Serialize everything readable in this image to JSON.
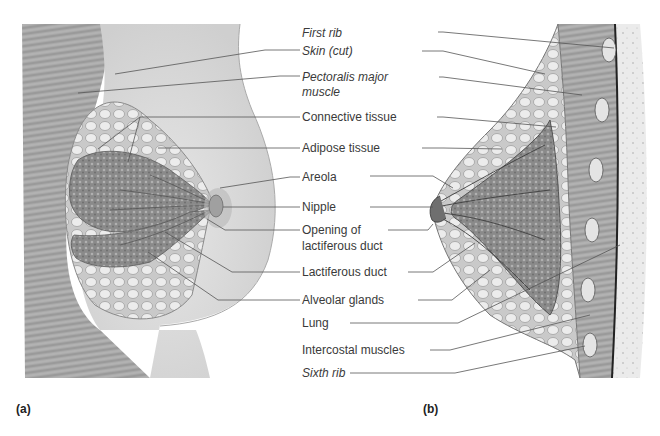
{
  "figure": {
    "panels": [
      {
        "id": "a",
        "tag": "(a)",
        "view": "anterior cutaway"
      },
      {
        "id": "b",
        "tag": "(b)",
        "view": "sagittal section"
      }
    ],
    "labels": [
      {
        "key": "first_rib",
        "text": "First rib",
        "italic": true
      },
      {
        "key": "skin_cut",
        "text": "Skin (cut)",
        "italic": true
      },
      {
        "key": "pectoralis_1",
        "text": "Pectoralis major",
        "italic": true
      },
      {
        "key": "pectoralis_2",
        "text": "muscle",
        "italic": true
      },
      {
        "key": "connective",
        "text": "Connective tissue",
        "italic": false
      },
      {
        "key": "adipose",
        "text": "Adipose tissue",
        "italic": false
      },
      {
        "key": "areola",
        "text": "Areola",
        "italic": false
      },
      {
        "key": "nipple",
        "text": "Nipple",
        "italic": false
      },
      {
        "key": "opening_1",
        "text": "Opening of",
        "italic": false
      },
      {
        "key": "opening_2",
        "text": "lactiferous duct",
        "italic": false
      },
      {
        "key": "lactiferous",
        "text": "Lactiferous duct",
        "italic": false
      },
      {
        "key": "alveolar",
        "text": "Alveolar glands",
        "italic": false
      },
      {
        "key": "lung",
        "text": "Lung",
        "italic": false
      },
      {
        "key": "intercostal",
        "text": "Intercostal muscles",
        "italic": false
      },
      {
        "key": "sixth_rib",
        "text": "Sixth rib",
        "italic": true
      }
    ]
  },
  "colors": {
    "background": "#ffffff",
    "text": "#3a3a3a",
    "leader": "#555555",
    "skin": "#dcdcdc",
    "muscle": "#9a9a9a",
    "gland": "#7e7e7e",
    "adipose": "#cfcfcf"
  }
}
